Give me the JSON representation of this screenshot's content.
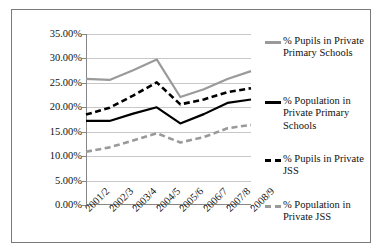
{
  "chart_data": {
    "type": "line",
    "title": "",
    "xlabel": "",
    "ylabel": "",
    "categories": [
      "2001/2",
      "2002/3",
      "2003/4",
      "2004/5",
      "2005/6",
      "2006/7",
      "2007/8",
      "2008/9"
    ],
    "ylim": [
      0,
      35
    ],
    "ytick_labels": [
      "0.00%",
      "5.00%",
      "10.00%",
      "15.00%",
      "20.00%",
      "25.00%",
      "30.00%",
      "35.00%"
    ],
    "ytick_values": [
      0,
      5,
      10,
      15,
      20,
      25,
      30,
      35
    ],
    "grid": true,
    "legend_position": "right",
    "series": [
      {
        "name": "% Pupils in Private Primary Schools",
        "style": "solid",
        "color": "#9a9a9a",
        "values": [
          25.8,
          25.6,
          27.6,
          29.8,
          22.1,
          23.7,
          25.8,
          27.4
        ]
      },
      {
        "name": "% Population in Private Primary Schools",
        "style": "solid",
        "color": "#000000",
        "values": [
          17.2,
          17.2,
          18.7,
          20.0,
          16.7,
          18.6,
          20.9,
          21.6
        ]
      },
      {
        "name": "% Pupils in Private JSS",
        "style": "dashed",
        "color": "#000000",
        "values": [
          18.5,
          19.9,
          22.4,
          25.1,
          20.6,
          21.6,
          23.1,
          23.9
        ]
      },
      {
        "name": "% Population in Private JSS",
        "style": "dashed",
        "color": "#9a9a9a",
        "values": [
          10.9,
          11.8,
          13.2,
          14.7,
          12.8,
          13.9,
          15.7,
          16.4
        ]
      }
    ]
  },
  "legend": {
    "items": [
      {
        "label_line1": "% Pupils in Private",
        "label_line2": "Primary Schools",
        "swatch": "solid-gray-line-icon"
      },
      {
        "label_line1": "% Population in",
        "label_line2": "Private Primary",
        "label_line3": "Schools",
        "swatch": "solid-black-line-icon"
      },
      {
        "label_line1": "% Pupils in Private",
        "label_line2": "JSS",
        "swatch": "dashed-black-line-icon"
      },
      {
        "label_line1": "% Population in",
        "label_line2": "Private JSS",
        "swatch": "dashed-gray-line-icon"
      }
    ]
  }
}
